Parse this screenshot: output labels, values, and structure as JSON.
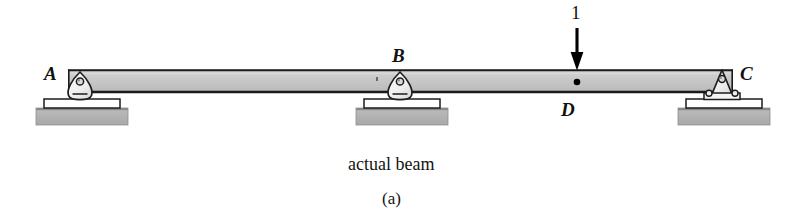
{
  "figure": {
    "caption": "actual beam",
    "subcaption": "(a)",
    "kind": "structural-beam-diagram"
  },
  "beam": {
    "label": "beam",
    "fill_color": "#c9c9c9",
    "edge_color": "#1a1a1a",
    "left_x": 68,
    "right_x": 733,
    "top_y": 70,
    "bottom_y": 92
  },
  "supports": [
    {
      "id": "A",
      "label": "A",
      "type": "rocker-support",
      "x": 80,
      "label_x": 44,
      "label_y": 66,
      "ground_color": "#b0b0b0"
    },
    {
      "id": "B",
      "label": "B",
      "type": "rocker-support",
      "x": 400,
      "label_x": 392,
      "label_y": 48,
      "ground_color": "#b0b0b0"
    },
    {
      "id": "C",
      "label": "C",
      "type": "pin-support",
      "x": 722,
      "label_x": 742,
      "label_y": 66,
      "ground_color": "#b0b0b0"
    }
  ],
  "load": {
    "magnitude_label": "1",
    "label_x": 570,
    "label_y": 4,
    "arrow_x": 577,
    "arrow_top_y": 28,
    "arrow_tip_y": 70,
    "color": "#000000"
  },
  "point_d": {
    "label": "D",
    "x": 577,
    "y": 82,
    "label_x": 562,
    "label_y": 102,
    "marker_color": "#000000"
  },
  "caption_positions": {
    "caption_x": 348,
    "caption_y": 158,
    "subcaption_x": 383,
    "subcaption_y": 192
  },
  "colors": {
    "beam_fill": "#c9c9c9",
    "beam_edge": "#1a1a1a",
    "ground_fill": "#b0b0b0",
    "plate_fill": "#ffffff",
    "support_fill": "#f2f2f2",
    "ink": "#111111"
  }
}
